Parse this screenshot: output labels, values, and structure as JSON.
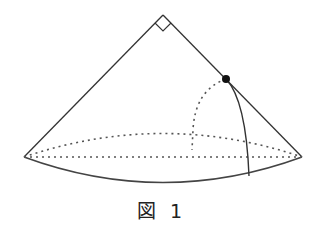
{
  "figure": {
    "caption": "図 1",
    "colors": {
      "line": "#333333",
      "background": "#ffffff"
    },
    "elements": {
      "apex": [
        163,
        15
      ],
      "left_corner": [
        24,
        157
      ],
      "right_corner": [
        302,
        157
      ],
      "point": [
        226,
        79
      ],
      "right_angle_marker": "square-at-apex",
      "base_front_arc": "solid",
      "base_back_arc": "dotted",
      "base_chord": "dotted",
      "hidden_arc_from_point": "dotted",
      "visible_curve_from_point": "solid"
    }
  }
}
